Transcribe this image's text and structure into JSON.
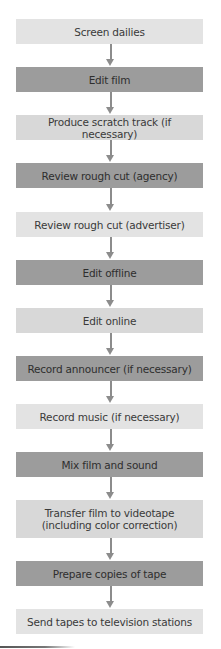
{
  "diagram": {
    "type": "flowchart",
    "direction": "top-to-bottom",
    "colors": {
      "light_box": "#e3e3e3",
      "medium_box": "#d8d8d8",
      "dark_box": "#9c9c9c",
      "arrow": "#8c8c8c",
      "text": "#3a3a3a"
    },
    "steps": [
      {
        "label": "Screen dailies",
        "shade": "light"
      },
      {
        "label": "Edit film",
        "shade": "dark"
      },
      {
        "label": "Produce scratch track (if necessary)",
        "shade": "medium"
      },
      {
        "label": "Review rough cut (agency)",
        "shade": "dark"
      },
      {
        "label": "Review rough cut (advertiser)",
        "shade": "light"
      },
      {
        "label": "Edit offline",
        "shade": "dark"
      },
      {
        "label": "Edit online",
        "shade": "medium"
      },
      {
        "label": "Record announcer (if necessary)",
        "shade": "dark"
      },
      {
        "label": "Record music (if necessary)",
        "shade": "light"
      },
      {
        "label": "Mix film and sound",
        "shade": "dark"
      },
      {
        "label": "Transfer film to videotape (including color correction)",
        "shade": "medium"
      },
      {
        "label": "Prepare copies of tape",
        "shade": "dark"
      },
      {
        "label": "Send tapes to television stations",
        "shade": "light"
      }
    ],
    "arrows": [
      {
        "from": 0,
        "to": 1,
        "icon": "arrow-down-icon"
      },
      {
        "from": 1,
        "to": 2,
        "icon": "arrow-down-icon"
      },
      {
        "from": 2,
        "to": 3,
        "icon": "arrow-down-icon"
      },
      {
        "from": 3,
        "to": 4,
        "icon": "arrow-down-icon"
      },
      {
        "from": 4,
        "to": 5,
        "icon": "arrow-down-icon"
      },
      {
        "from": 5,
        "to": 6,
        "icon": "arrow-down-icon"
      },
      {
        "from": 6,
        "to": 7,
        "icon": "arrow-down-icon"
      },
      {
        "from": 7,
        "to": 8,
        "icon": "arrow-down-icon"
      },
      {
        "from": 8,
        "to": 9,
        "icon": "arrow-down-icon"
      },
      {
        "from": 9,
        "to": 10,
        "icon": "arrow-down-icon"
      },
      {
        "from": 10,
        "to": 11,
        "icon": "arrow-down-icon"
      },
      {
        "from": 11,
        "to": 12,
        "icon": "arrow-down-icon"
      }
    ]
  }
}
